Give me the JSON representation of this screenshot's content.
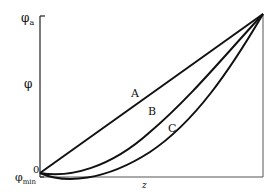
{
  "diagram": {
    "y_axis": {
      "top_label": "φ",
      "top_label_sub": "a",
      "mid_label": "φ",
      "zero_label": "0",
      "min_label": "φ",
      "min_label_sub": "min"
    },
    "x_axis": {
      "label": "z"
    },
    "curves": [
      {
        "name": "A",
        "label": "A",
        "shape": "straight line"
      },
      {
        "name": "B",
        "label": "B",
        "shape": "convex curve dipping slightly below start"
      },
      {
        "name": "C",
        "label": "C",
        "shape": "more convex curve dipping further below start"
      }
    ],
    "colors": {
      "line": "#111111",
      "frame": "#555555",
      "background": "#ffffff"
    }
  }
}
